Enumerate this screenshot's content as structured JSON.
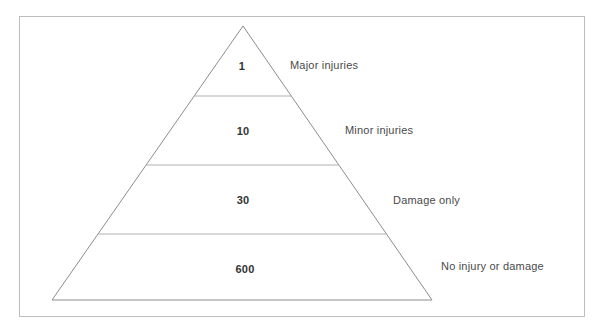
{
  "diagram": {
    "type": "accident-pyramid",
    "title": "",
    "frame": {
      "border_color": "#bdbdbd"
    },
    "pyramid": {
      "outline_color": "#8c8c8c",
      "divider_color": "#b0b0b0",
      "fill_color": "#ffffff",
      "apex": {
        "x": 243,
        "y": 26
      },
      "base_left": {
        "x": 52,
        "y": 300
      },
      "base_right": {
        "x": 432,
        "y": 300
      },
      "dividers_y": [
        96,
        165,
        234
      ]
    },
    "tiers": [
      {
        "id": "tier-major-injuries",
        "count": "1",
        "label": "Major injuries",
        "number_pos": {
          "x": 242,
          "y": 66
        },
        "label_pos": {
          "x": 290,
          "y": 65
        }
      },
      {
        "id": "tier-minor-injuries",
        "count": "10",
        "label": "Minor injuries",
        "number_pos": {
          "x": 243,
          "y": 131
        },
        "label_pos": {
          "x": 345,
          "y": 130
        }
      },
      {
        "id": "tier-damage-only",
        "count": "30",
        "label": "Damage only",
        "number_pos": {
          "x": 243,
          "y": 200
        },
        "label_pos": {
          "x": 393,
          "y": 200
        }
      },
      {
        "id": "tier-no-injury-or-damage",
        "count": "600",
        "label": "No injury or damage",
        "number_pos": {
          "x": 245,
          "y": 269
        },
        "label_pos": {
          "x": 441,
          "y": 266
        }
      }
    ]
  },
  "chart_data": {
    "type": "pyramid",
    "categories": [
      "Major injuries",
      "Minor injuries",
      "Damage only",
      "No injury or damage"
    ],
    "values": [
      1,
      10,
      30,
      600
    ],
    "value_labels": [
      "1",
      "10",
      "30",
      "600"
    ],
    "order": "top-to-bottom",
    "xlabel": "",
    "ylabel": "",
    "legend": "none",
    "grid": false
  }
}
